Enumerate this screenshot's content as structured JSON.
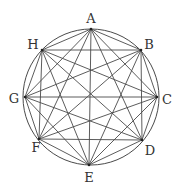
{
  "diagram": {
    "type": "complete-graph-K8-inscribed-in-circle",
    "circle": {
      "cx": 91,
      "cy": 97,
      "r": 68
    },
    "colors": {
      "line": "#4a4a4a",
      "label": "#333333",
      "background": "#ffffff"
    },
    "vertices": [
      {
        "id": "A",
        "label": "A",
        "x": 91,
        "y": 29,
        "lx": 91,
        "ly": 18
      },
      {
        "id": "B",
        "label": "B",
        "x": 141,
        "y": 50,
        "lx": 149,
        "ly": 44
      },
      {
        "id": "C",
        "label": "C",
        "x": 157,
        "y": 97,
        "lx": 167,
        "ly": 99
      },
      {
        "id": "D",
        "label": "D",
        "x": 142,
        "y": 140,
        "lx": 150,
        "ly": 150
      },
      {
        "id": "E",
        "label": "E",
        "x": 89,
        "y": 165,
        "lx": 89,
        "ly": 177
      },
      {
        "id": "F",
        "label": "F",
        "x": 39,
        "y": 139,
        "lx": 36,
        "ly": 147
      },
      {
        "id": "G",
        "label": "G",
        "x": 25,
        "y": 97,
        "lx": 14,
        "ly": 98
      },
      {
        "id": "H",
        "label": "H",
        "x": 42,
        "y": 50,
        "lx": 33,
        "ly": 44
      }
    ],
    "edges": "all pairs (complete graph, 28 edges)"
  }
}
